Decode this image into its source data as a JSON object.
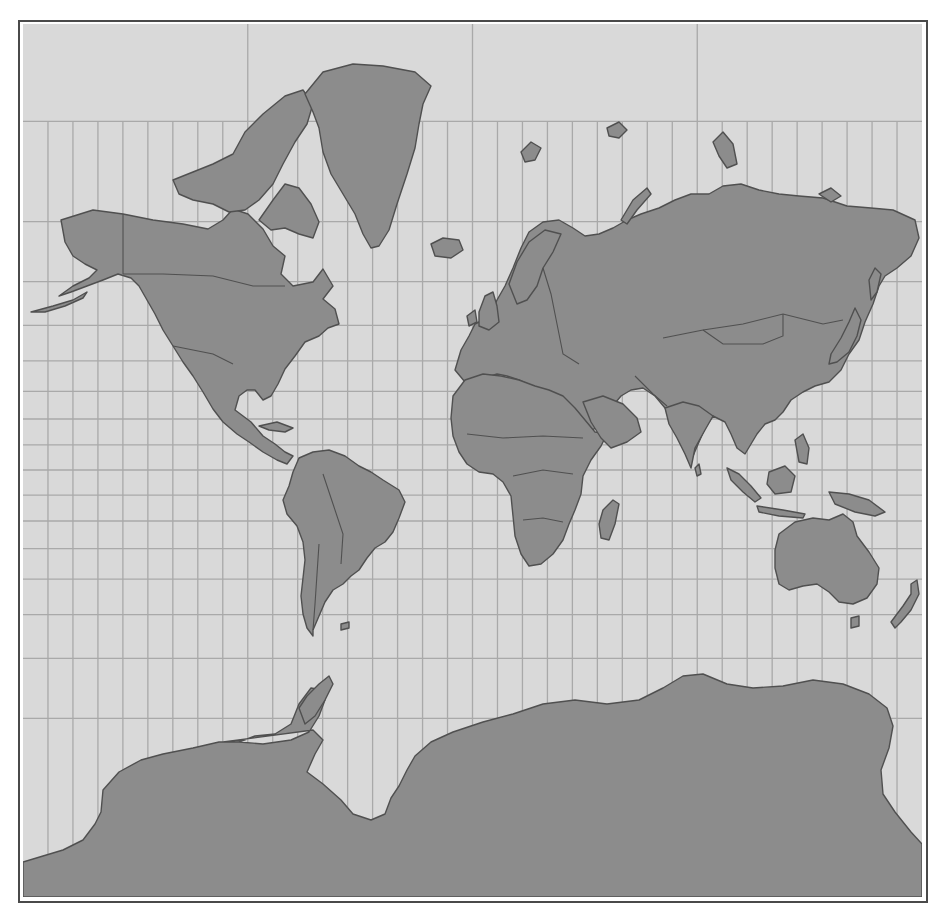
{
  "map": {
    "title": "",
    "projection": "Mercator",
    "colors": {
      "ocean": "#d9d9d9",
      "land": "#8c8c8c",
      "coastline": "#505050",
      "graticule": "#a9a9a9",
      "frame": "#4a4a4a"
    },
    "graticule": {
      "longitude_step_deg": 10,
      "latitude_lines_deg": [
        80,
        70,
        60,
        50,
        40,
        30,
        20,
        10,
        0,
        -10,
        -20,
        -30,
        -40,
        -50,
        -60,
        -70
      ],
      "polar_longitude_lines_deg": [
        -90,
        0,
        90
      ]
    },
    "regions_shown": [
      "North America",
      "Greenland",
      "South America",
      "Europe",
      "Africa",
      "Asia",
      "Australia",
      "New Zealand",
      "Antarctica",
      "Madagascar",
      "Japan",
      "Indonesia",
      "Iceland",
      "British Isles",
      "Svalbard"
    ],
    "labels": []
  }
}
